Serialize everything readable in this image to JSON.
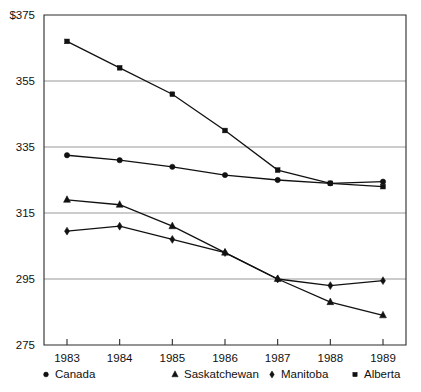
{
  "chart_data": {
    "type": "line",
    "title": "",
    "xlabel": "",
    "ylabel": "",
    "categories": [
      "1983",
      "1984",
      "1985",
      "1986",
      "1987",
      "1988",
      "1989"
    ],
    "x_tick_labels": [
      "1983",
      "1984",
      "1985",
      "1986",
      "1987",
      "1988",
      "1989"
    ],
    "y_tick_labels": [
      "$375",
      "355",
      "335",
      "315",
      "295",
      "275"
    ],
    "y_tick_values": [
      375,
      355,
      335,
      315,
      295,
      275
    ],
    "ylim": [
      275,
      375
    ],
    "xlim": [
      1982.6,
      1989.45
    ],
    "grid": "horizontal",
    "legend_position": "bottom",
    "currency_symbol": "$",
    "series": [
      {
        "name": "Canada",
        "marker": "circle",
        "color": "#111111",
        "values": [
          332.5,
          331.0,
          329.0,
          326.5,
          325.0,
          324.0,
          324.5
        ]
      },
      {
        "name": "Saskatchewan",
        "marker": "triangle",
        "color": "#111111",
        "values": [
          319.0,
          317.5,
          311.0,
          303.0,
          295.0,
          288.0,
          284.0
        ]
      },
      {
        "name": "Manitoba",
        "marker": "diamond",
        "color": "#111111",
        "values": [
          309.5,
          311.0,
          307.0,
          303.0,
          295.0,
          293.0,
          294.5
        ]
      },
      {
        "name": "Alberta",
        "marker": "square",
        "color": "#111111",
        "values": [
          367.0,
          359.0,
          351.0,
          340.0,
          328.0,
          324.0,
          323.0
        ]
      }
    ]
  },
  "legend": {
    "items": [
      {
        "label": "Canada",
        "marker": "circle"
      },
      {
        "label": "Saskatchewan",
        "marker": "triangle"
      },
      {
        "label": "Manitoba",
        "marker": "diamond"
      },
      {
        "label": "Alberta",
        "marker": "square"
      }
    ]
  }
}
